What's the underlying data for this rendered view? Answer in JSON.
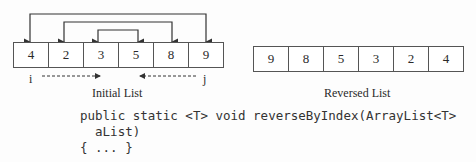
{
  "initial_list": {
    "values": [
      "4",
      "2",
      "3",
      "5",
      "8",
      "9"
    ],
    "caption": "Initial List",
    "index_left": "i",
    "index_right": "j"
  },
  "reversed_list": {
    "values": [
      "9",
      "8",
      "5",
      "3",
      "2",
      "4"
    ],
    "caption": "Reversed List"
  },
  "code": {
    "line1": "public static <T> void reverseByIndex(ArrayList<T>",
    "line2": "  aList)",
    "line3": "{ ... }"
  }
}
